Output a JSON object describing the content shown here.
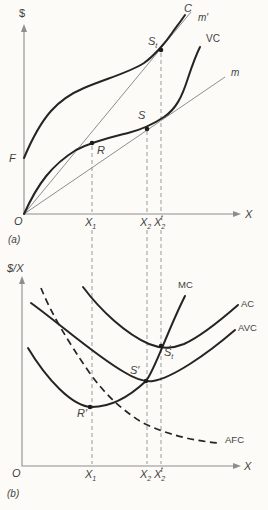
{
  "figure": {
    "colors": {
      "background": "#fcfbf7",
      "curve_ink": "#242424",
      "axis_gray": "#8e8e8e",
      "text": "#3f3f3f"
    },
    "panel_a": {
      "label": "(a)",
      "y_axis": "$",
      "x_axis": "X",
      "origin": "O",
      "intercept": "F",
      "curve_total_cost": "C",
      "curve_variable_cost": "VC",
      "ray_m_prime": "m′",
      "ray_m": "m",
      "point_r": "R",
      "point_s": "S",
      "point_st": {
        "base": "S",
        "sub": "t"
      }
    },
    "panel_b": {
      "label": "(b)",
      "y_axis": "$/X",
      "x_axis": "X",
      "origin": "O",
      "curve_mc": "MC",
      "curve_ac": "AC",
      "curve_avc": "AVC",
      "curve_afc": "AFC",
      "point_r": "R′",
      "point_s": "S′",
      "point_st": {
        "base": "S",
        "sub": "t",
        "prime": "′"
      }
    },
    "ticks": {
      "x1": {
        "base": "X",
        "sub": "1"
      },
      "x2": {
        "base": "X",
        "sub": "2"
      },
      "x2t": {
        "base": "X",
        "sub": "2",
        "sup": "t"
      }
    }
  }
}
